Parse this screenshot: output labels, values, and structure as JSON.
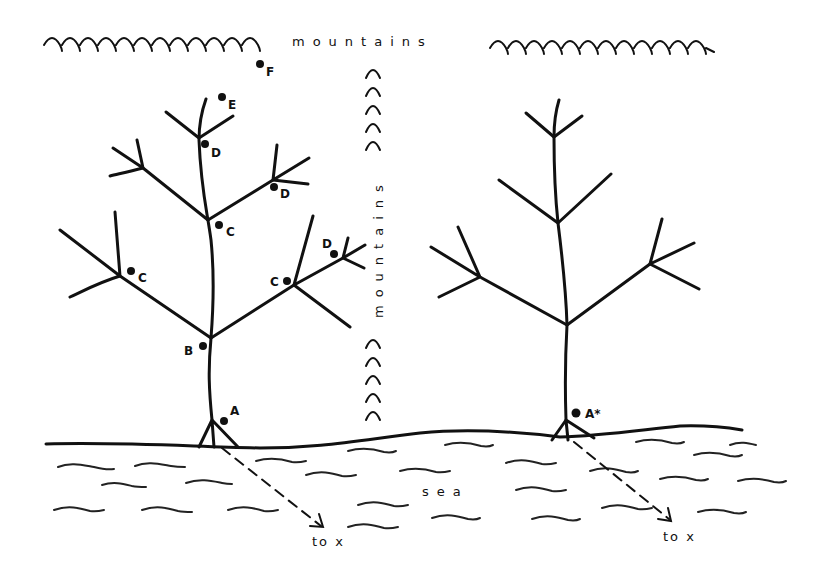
{
  "diagram": {
    "type": "illustration",
    "labels": {
      "mountains_top": "mountains",
      "mountains_vertical": "mountains",
      "sea": "sea",
      "to_x_left": "to x",
      "to_x_right": "to x"
    },
    "left_tree": {
      "points": [
        {
          "id": "A",
          "label": "A",
          "x": 224,
          "y": 421
        },
        {
          "id": "B",
          "label": "B",
          "x": 203,
          "y": 346
        },
        {
          "id": "C1",
          "label": "C",
          "x": 131,
          "y": 271
        },
        {
          "id": "C2",
          "label": "C",
          "x": 219,
          "y": 225
        },
        {
          "id": "C3",
          "label": "C",
          "x": 287,
          "y": 281
        },
        {
          "id": "D1",
          "label": "D",
          "x": 205,
          "y": 144
        },
        {
          "id": "D2",
          "label": "D",
          "x": 274,
          "y": 187
        },
        {
          "id": "D3",
          "label": "D",
          "x": 334,
          "y": 254
        },
        {
          "id": "E",
          "label": "E",
          "x": 222,
          "y": 97
        },
        {
          "id": "F",
          "label": "F",
          "x": 260,
          "y": 64
        }
      ]
    },
    "right_tree": {
      "points": [
        {
          "id": "A*",
          "label": "A*",
          "x": 576,
          "y": 413
        }
      ]
    },
    "colors": {
      "ink": "#111111",
      "background": "#ffffff"
    }
  }
}
